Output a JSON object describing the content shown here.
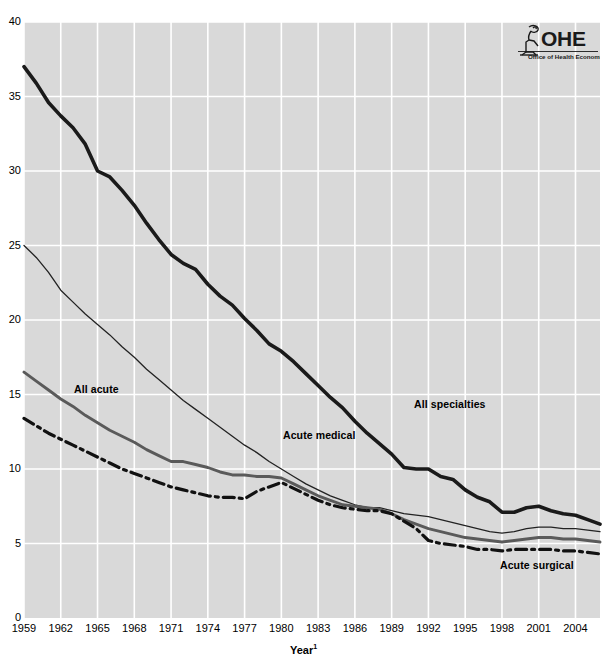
{
  "logo": {
    "name": "ohe-logo",
    "acronym": "OHE",
    "tagline": "Office of Health Economics"
  },
  "axes": {
    "x_title": "Year",
    "x_title_superscript": "1",
    "y_ticks": [
      "0",
      "5",
      "10",
      "15",
      "20",
      "25",
      "30",
      "35",
      "40"
    ],
    "x_ticks": [
      "1959",
      "1962",
      "1965",
      "1968",
      "1971",
      "1974",
      "1977",
      "1980",
      "1983",
      "1986",
      "1989",
      "1992",
      "1995",
      "1998",
      "2001",
      "2004"
    ]
  },
  "series_labels": {
    "all_acute": "All acute",
    "acute_medical": "Acute medical",
    "all_specialties": "All specialties",
    "acute_surgical": "Acute surgical"
  },
  "style": {
    "plot_background": "#d9d9d9",
    "grid_color": "#ffffff",
    "page_background": "#ffffff",
    "all_specialties_color": "#1a1a1a",
    "acute_medical_color": "#222222",
    "all_acute_color": "#5a5a5a",
    "acute_surgical_color": "#111111"
  },
  "chart_data": {
    "type": "line",
    "title": "",
    "subtitle": "",
    "xlabel": "Year",
    "ylabel": "",
    "xlim": [
      1959,
      2006
    ],
    "ylim": [
      0,
      40
    ],
    "grid": true,
    "legend_position": "inline-annotations",
    "x": [
      1959,
      1960,
      1961,
      1962,
      1963,
      1964,
      1965,
      1966,
      1967,
      1968,
      1969,
      1970,
      1971,
      1972,
      1973,
      1974,
      1975,
      1976,
      1977,
      1978,
      1979,
      1980,
      1981,
      1982,
      1983,
      1984,
      1985,
      1986,
      1987,
      1988,
      1989,
      1990,
      1991,
      1992,
      1993,
      1994,
      1995,
      1996,
      1997,
      1998,
      1999,
      2000,
      2001,
      2002,
      2003,
      2004,
      2005,
      2006
    ],
    "series": [
      {
        "name": "All specialties",
        "style": "thick-solid",
        "color": "#1a1a1a",
        "values": [
          37.0,
          35.9,
          34.6,
          33.7,
          32.9,
          31.8,
          30.0,
          29.6,
          28.7,
          27.7,
          26.5,
          25.4,
          24.4,
          23.8,
          23.4,
          22.4,
          21.6,
          21.0,
          20.1,
          19.3,
          18.4,
          17.9,
          17.2,
          16.4,
          15.6,
          14.8,
          14.1,
          13.2,
          12.4,
          11.7,
          11.0,
          10.1,
          10.0,
          10.0,
          9.5,
          9.3,
          8.6,
          8.1,
          7.8,
          7.1,
          7.1,
          7.4,
          7.5,
          7.2,
          7.0,
          6.9,
          6.6,
          6.3
        ]
      },
      {
        "name": "Acute medical",
        "style": "thin-solid",
        "color": "#222222",
        "values": [
          25.0,
          24.2,
          23.2,
          22.0,
          21.2,
          20.4,
          19.7,
          19.0,
          18.2,
          17.5,
          16.7,
          16.0,
          15.3,
          14.6,
          14.0,
          13.4,
          12.8,
          12.2,
          11.6,
          11.1,
          10.5,
          10.0,
          9.5,
          9.0,
          8.6,
          8.2,
          7.9,
          7.6,
          7.4,
          7.4,
          7.2,
          7.0,
          6.9,
          6.8,
          6.6,
          6.4,
          6.2,
          6.0,
          5.8,
          5.7,
          5.8,
          6.0,
          6.1,
          6.1,
          6.0,
          6.0,
          5.9,
          5.8
        ]
      },
      {
        "name": "All acute",
        "style": "medium-solid",
        "color": "#5a5a5a",
        "values": [
          16.5,
          15.9,
          15.3,
          14.7,
          14.2,
          13.6,
          13.1,
          12.6,
          12.2,
          11.8,
          11.3,
          10.9,
          10.5,
          10.5,
          10.3,
          10.1,
          9.8,
          9.6,
          9.6,
          9.5,
          9.5,
          9.4,
          9.0,
          8.6,
          8.2,
          7.9,
          7.6,
          7.5,
          7.4,
          7.3,
          7.0,
          6.6,
          6.3,
          6.0,
          5.8,
          5.6,
          5.4,
          5.3,
          5.2,
          5.1,
          5.2,
          5.3,
          5.4,
          5.4,
          5.3,
          5.3,
          5.2,
          5.1
        ]
      },
      {
        "name": "Acute surgical",
        "style": "dash-dot",
        "color": "#111111",
        "values": [
          13.4,
          12.9,
          12.4,
          12.0,
          11.6,
          11.2,
          10.8,
          10.4,
          10.0,
          9.7,
          9.4,
          9.1,
          8.8,
          8.6,
          8.4,
          8.2,
          8.1,
          8.1,
          8.0,
          8.5,
          8.8,
          9.1,
          8.7,
          8.3,
          7.9,
          7.6,
          7.4,
          7.3,
          7.2,
          7.2,
          7.0,
          6.5,
          6.0,
          5.2,
          5.0,
          4.9,
          4.8,
          4.6,
          4.6,
          4.5,
          4.6,
          4.6,
          4.6,
          4.6,
          4.5,
          4.5,
          4.4,
          4.3
        ]
      }
    ]
  }
}
